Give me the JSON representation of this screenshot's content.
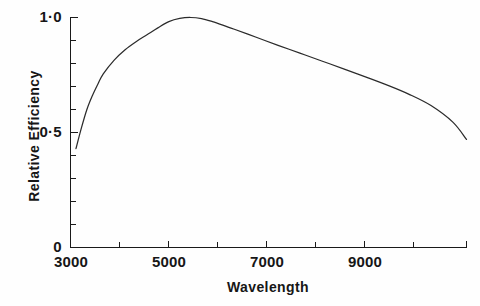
{
  "chart_data": {
    "type": "line",
    "title": "",
    "xlabel": "Wavelength",
    "ylabel": "Relative  Efficiency",
    "xlim": [
      3000,
      10250
    ],
    "ylim": [
      0,
      1.0
    ],
    "grid": false,
    "legend": "none",
    "x_tick_labels": [
      "3000",
      "5000",
      "7000",
      "9000"
    ],
    "x_tick_values": [
      3000,
      5000,
      7000,
      9000
    ],
    "x_minor_tick_values": [
      4000,
      6000,
      8000,
      10000
    ],
    "y_tick_labels": [
      "0",
      "0·5",
      "1·0"
    ],
    "y_tick_values": [
      0,
      0.5,
      1.0
    ],
    "y_minor_tick_values": [
      0.1,
      0.2,
      0.3,
      0.4,
      0.6,
      0.7,
      0.8,
      0.9
    ],
    "series": [
      {
        "name": "Relative Efficiency",
        "x": [
          3100,
          3200,
          3300,
          3400,
          3500,
          3600,
          3800,
          4000,
          4200,
          4400,
          4600,
          4800,
          5000,
          5200,
          5400,
          5600,
          5800,
          6000,
          6400,
          6800,
          7200,
          7600,
          8000,
          8400,
          8800,
          9200,
          9600,
          10000,
          10250
        ],
        "values": [
          0.43,
          0.52,
          0.6,
          0.66,
          0.71,
          0.755,
          0.815,
          0.86,
          0.895,
          0.925,
          0.955,
          0.982,
          0.996,
          1.0,
          0.995,
          0.982,
          0.966,
          0.949,
          0.914,
          0.879,
          0.845,
          0.811,
          0.777,
          0.742,
          0.706,
          0.666,
          0.617,
          0.545,
          0.47
        ]
      }
    ],
    "line_color": "#2b2b2b",
    "background_color": "#fefefe",
    "axis_color": "#1a1a1a"
  },
  "axis_titles": {
    "x": "Wavelength",
    "y": "Relative  Efficiency"
  }
}
